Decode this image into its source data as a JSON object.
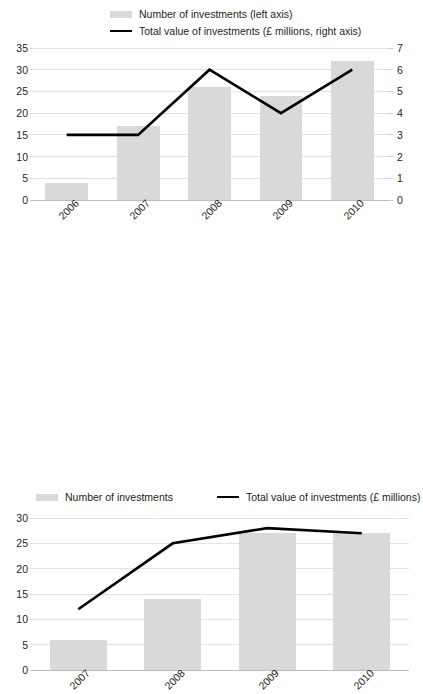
{
  "charts": {
    "top": {
      "legend": [
        {
          "marker": "bar-swatch-icon",
          "label": "Number of investments (left axis)"
        },
        {
          "marker": "line-swatch-icon",
          "label": "Total value of investments (£ millions, right axis)"
        }
      ]
    },
    "bottom": {
      "legend": [
        {
          "marker": "bar-swatch-icon",
          "label": "Number of investments"
        },
        {
          "marker": "line-swatch-icon",
          "label": "Total value of investments (£ millions)"
        }
      ]
    }
  },
  "chart_data": [
    {
      "type": "bar",
      "id": "top",
      "title": "",
      "xlabel": "",
      "ylabel": "",
      "grid": true,
      "legend_position": "top",
      "categories": [
        "2006",
        "2007",
        "2008",
        "2009",
        "2010"
      ],
      "series": [
        {
          "name": "Number of investments (left axis)",
          "type": "bar",
          "axis": "left",
          "color": "#d9d9d9",
          "values": [
            4,
            17,
            26,
            24,
            32
          ]
        },
        {
          "name": "Total value of investments (£ millions, right axis)",
          "type": "line",
          "axis": "right",
          "color": "#000000",
          "values": [
            3,
            3,
            6,
            4,
            6
          ]
        }
      ],
      "left_axis": {
        "ticks": [
          0,
          5,
          10,
          15,
          20,
          25,
          30,
          35
        ],
        "ylim": [
          0,
          35
        ]
      },
      "right_axis": {
        "ticks": [
          0,
          1,
          2,
          3,
          4,
          5,
          6,
          7
        ],
        "ylim": [
          0,
          7
        ]
      }
    },
    {
      "type": "bar",
      "id": "bottom",
      "title": "",
      "xlabel": "",
      "ylabel": "",
      "grid": true,
      "legend_position": "top",
      "categories": [
        "2007",
        "2008",
        "2009",
        "2010"
      ],
      "series": [
        {
          "name": "Number of investments",
          "type": "bar",
          "axis": "left",
          "color": "#d9d9d9",
          "values": [
            6,
            14,
            27,
            27
          ]
        },
        {
          "name": "Total value of investments (£ millions)",
          "type": "line",
          "axis": "left",
          "color": "#000000",
          "values": [
            12,
            25,
            28,
            27
          ]
        }
      ],
      "left_axis": {
        "ticks": [
          0,
          5,
          10,
          15,
          20,
          25,
          30
        ],
        "ylim": [
          0,
          30
        ]
      }
    }
  ]
}
